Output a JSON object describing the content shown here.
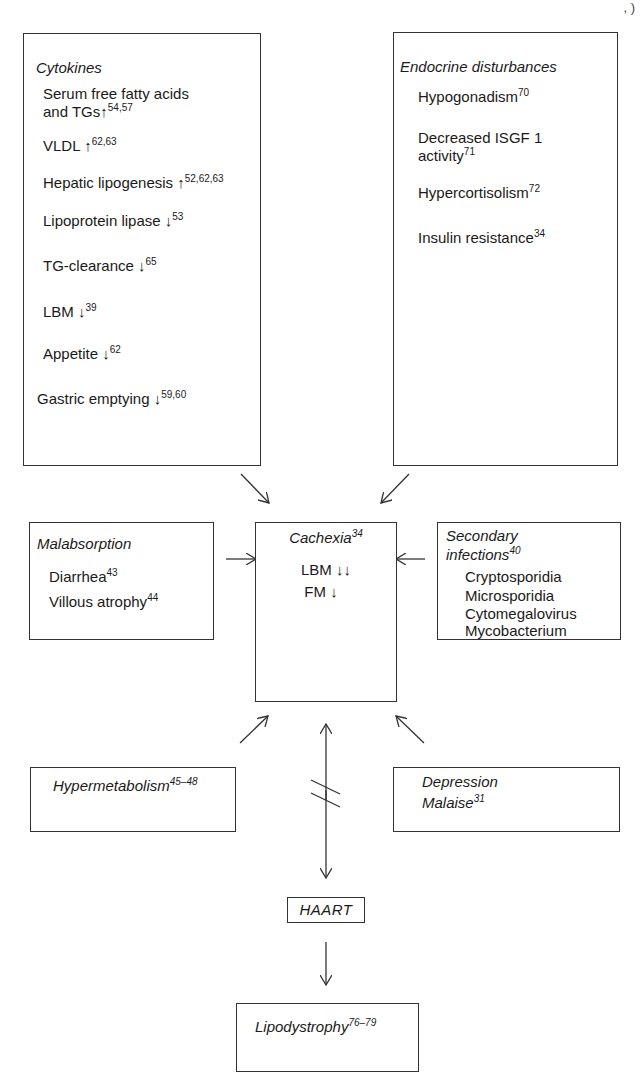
{
  "page_corner_mark": ", )",
  "boxes": {
    "cytokines": {
      "title": "Cytokines",
      "items": [
        {
          "l1": "Serum free fatty acids",
          "l2": "and TGs",
          "arrow": "↑",
          "ref": "54,57"
        },
        {
          "text": "VLDL ",
          "arrow": "↑",
          "ref": "62,63"
        },
        {
          "text": "Hepatic lipogenesis ",
          "arrow": "↑",
          "ref": "52,62,63"
        },
        {
          "text": "Lipoprotein lipase ",
          "arrow": "↓",
          "ref": "53"
        },
        {
          "text": "TG-clearance ",
          "arrow": "↓",
          "ref": "65"
        },
        {
          "text": "LBM ",
          "arrow": "↓",
          "ref": "39"
        },
        {
          "text": "Appetite ",
          "arrow": "↓",
          "ref": "62"
        },
        {
          "text": "Gastric emptying ",
          "arrow": "↓",
          "ref": "59,60"
        }
      ]
    },
    "endocrine": {
      "title": "Endocrine disturbances",
      "items": [
        {
          "text": "Hypogonadism",
          "ref": "70"
        },
        {
          "l1": "Decreased ISGF 1",
          "l2": "activity",
          "ref": "71"
        },
        {
          "text": "Hypercortisolism",
          "ref": "72"
        },
        {
          "text": "Insulin resistance",
          "ref": "34"
        }
      ]
    },
    "malabsorption": {
      "title": "Malabsorption",
      "items": [
        {
          "text": "Diarrhea",
          "ref": "43"
        },
        {
          "text": "Villous atrophy",
          "ref": "44"
        }
      ]
    },
    "cachexia": {
      "title": "Cachexia",
      "title_ref": "34",
      "items": [
        {
          "text": "LBM ",
          "arrow": "↓↓"
        },
        {
          "text": "FM ",
          "arrow": "↓"
        }
      ]
    },
    "secondary_infections": {
      "title_l1": "Secondary",
      "title_l2": "infections",
      "title_ref": "40",
      "items": [
        "Cryptosporidia",
        "Microsporidia",
        "Cytomegalovirus",
        "Mycobacterium"
      ]
    },
    "hypermetabolism": {
      "title": "Hypermetabolism",
      "title_ref": "45–48"
    },
    "depression": {
      "title_l1": "Depression",
      "title_l2": "Malaise",
      "title_ref": "31"
    },
    "haart": {
      "title": "HAART"
    },
    "lipodystrophy": {
      "title": "Lipodystrophy",
      "title_ref": "76–79"
    }
  },
  "connectors": [
    {
      "from": "cytokines",
      "to": "cachexia",
      "type": "arrow"
    },
    {
      "from": "endocrine",
      "to": "cachexia",
      "type": "arrow"
    },
    {
      "from": "malabsorption",
      "to": "cachexia",
      "type": "arrow"
    },
    {
      "from": "secondary_infections",
      "to": "cachexia",
      "type": "arrow"
    },
    {
      "from": "hypermetabolism",
      "to": "cachexia",
      "type": "arrow"
    },
    {
      "from": "depression",
      "to": "cachexia",
      "type": "arrow"
    },
    {
      "from": "cachexia",
      "to": "haart",
      "type": "bidirectional-interrupted"
    },
    {
      "from": "haart",
      "to": "lipodystrophy",
      "type": "arrow"
    }
  ]
}
